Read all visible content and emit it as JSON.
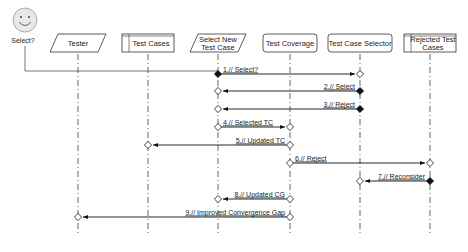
{
  "actor": {
    "label": "Select?",
    "x": 25,
    "icon": "smiley-face-icon"
  },
  "lifelines": [
    {
      "id": "tester",
      "label": [
        "Tester"
      ],
      "shape": "parallelogram",
      "x": 78
    },
    {
      "id": "test-cases",
      "label": [
        "Test Cases"
      ],
      "shape": "datastore",
      "x": 148
    },
    {
      "id": "select-new-test-case",
      "label": [
        "Select New",
        "Test Case"
      ],
      "shape": "parallelogram",
      "x": 218
    },
    {
      "id": "test-coverage",
      "label": [
        "Test Coverage"
      ],
      "shape": "rounded",
      "x": 290
    },
    {
      "id": "test-case-selector",
      "label": [
        "Test Case Selector"
      ],
      "shape": "rounded",
      "x": 360
    },
    {
      "id": "rejected-test-cases",
      "label": [
        "Rejected Test",
        "Cases"
      ],
      "shape": "datastore",
      "x": 430
    }
  ],
  "messages": [
    {
      "n": 1,
      "label": "1.// Select?",
      "from": "select-new-test-case",
      "to": "test-case-selector",
      "y": 74
    },
    {
      "n": 2,
      "label": "2.// Select",
      "from": "test-case-selector",
      "to": "select-new-test-case",
      "y": 91
    },
    {
      "n": 3,
      "label": "3.// Reject",
      "from": "test-case-selector",
      "to": "select-new-test-case",
      "y": 109
    },
    {
      "n": 4,
      "label": "4.// Selected TC",
      "from": "select-new-test-case",
      "to": "test-coverage",
      "y": 127
    },
    {
      "n": 5,
      "label": "5.// Updated TC",
      "from": "test-coverage",
      "to": "test-cases",
      "y": 145
    },
    {
      "n": 6,
      "label": "6.// Reject",
      "from": "test-coverage",
      "to": "rejected-test-cases",
      "y": 163
    },
    {
      "n": 7,
      "label": "7.// Reconsider",
      "from": "rejected-test-cases",
      "to": "test-case-selector",
      "y": 181
    },
    {
      "n": 8,
      "label": "8.// Updated CG",
      "from": "test-coverage",
      "to": "select-new-test-case",
      "y": 199
    },
    {
      "n": 9,
      "label": "9.// Improved Convergence Gap",
      "from": "test-coverage",
      "to": "tester",
      "y": 217
    }
  ],
  "colors": {
    "line": "#222222",
    "box_border": "#333333",
    "actor_fill": "#e8e8e8"
  }
}
